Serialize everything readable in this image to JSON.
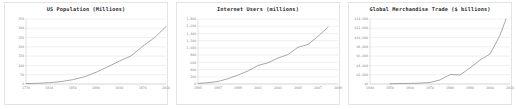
{
  "figure": {
    "name": "three-growth-line-charts",
    "background": "#ffffff",
    "panel_border": "#e3e3e3",
    "line_color": "#8c8c8c",
    "grid_color": "#d9d9d9",
    "text_color": "#8a8a8a",
    "title_color": "#2b2b2b"
  },
  "chart_data": [
    {
      "type": "line",
      "title": "US Population (Millions)",
      "xlabel": "",
      "ylabel": "",
      "grid": true,
      "legend": "none",
      "xlim": [
        1770,
        2010
      ],
      "ylim": [
        0,
        350
      ],
      "xticks": [
        1770,
        1810,
        1850,
        1890,
        1930,
        1970,
        2010
      ],
      "yticks": [
        0,
        50,
        100,
        150,
        200,
        250,
        300,
        350
      ],
      "xticklabels": [
        "1770",
        "1810",
        "1850",
        "1890",
        "1930",
        "1970",
        "2010"
      ],
      "yticklabels": [
        "0",
        "50",
        "100",
        "150",
        "200",
        "250",
        "300",
        "350"
      ],
      "x": [
        1770,
        1790,
        1810,
        1830,
        1850,
        1870,
        1890,
        1910,
        1930,
        1950,
        1970,
        1990,
        2010
      ],
      "y": [
        2.1,
        3.9,
        7.2,
        12.9,
        23.2,
        38.6,
        63.0,
        92.2,
        123.2,
        151.3,
        203.2,
        248.7,
        309.3
      ],
      "series": [
        {
          "name": "US Population",
          "values": [
            2.1,
            3.9,
            7.2,
            12.9,
            23.2,
            38.6,
            63.0,
            92.2,
            123.2,
            151.3,
            203.2,
            248.7,
            309.3
          ]
        }
      ]
    },
    {
      "type": "line",
      "title": "Internet Users (millions)",
      "xlabel": "",
      "ylabel": "",
      "grid": true,
      "legend": "none",
      "xlim": [
        1995,
        2009
      ],
      "ylim": [
        0,
        1800
      ],
      "xticks": [
        1995,
        1997,
        1999,
        2001,
        2003,
        2005,
        2007,
        2009
      ],
      "yticks": [
        0,
        200,
        400,
        600,
        800,
        1000,
        1200,
        1400,
        1600,
        1800
      ],
      "xticklabels": [
        "1995",
        "1997",
        "1999",
        "2001",
        "2003",
        "2005",
        "2007",
        "2009"
      ],
      "yticklabels": [
        "0",
        "200",
        "400",
        "600",
        "800",
        "1,000",
        "1,200",
        "1,400",
        "1,600",
        "1,800"
      ],
      "x": [
        1995,
        1996,
        1997,
        1998,
        1999,
        2000,
        2001,
        2002,
        2003,
        2004,
        2005,
        2006,
        2007,
        2008
      ],
      "y": [
        16,
        36,
        70,
        147,
        248,
        361,
        513,
        587,
        719,
        817,
        1018,
        1093,
        1319,
        1574
      ],
      "series": [
        {
          "name": "Internet Users",
          "values": [
            16,
            36,
            70,
            147,
            248,
            361,
            513,
            587,
            719,
            817,
            1018,
            1093,
            1319,
            1574
          ]
        }
      ]
    },
    {
      "type": "line",
      "title": "Global Merchandise Trade ($ billions)",
      "xlabel": "",
      "ylabel": "",
      "grid": true,
      "legend": "none",
      "xlim": [
        1940,
        2010
      ],
      "ylim": [
        0,
        14000
      ],
      "xticks": [
        1940,
        1950,
        1960,
        1970,
        1980,
        1990,
        2000,
        2010
      ],
      "yticks": [
        0,
        2000,
        4000,
        6000,
        8000,
        10000,
        12000,
        14000
      ],
      "xticklabels": [
        "1940",
        "1950",
        "1960",
        "1970",
        "1980",
        "1990",
        "2000",
        "2010"
      ],
      "yticklabels": [
        "$0",
        "$2,000",
        "$4,000",
        "$6,000",
        "$8,000",
        "$10,000",
        "$12,000",
        "$14,000"
      ],
      "x": [
        1950,
        1955,
        1960,
        1965,
        1970,
        1975,
        1980,
        1985,
        1990,
        1995,
        2000,
        2005,
        2008
      ],
      "y": [
        62,
        95,
        130,
        190,
        317,
        877,
        2034,
        1954,
        3449,
        5168,
        6456,
        10489,
        16127
      ],
      "series": [
        {
          "name": "Global Merchandise Trade",
          "values": [
            62,
            95,
            130,
            190,
            317,
            877,
            2034,
            1954,
            3449,
            5168,
            6456,
            10489,
            13500
          ]
        }
      ]
    }
  ]
}
